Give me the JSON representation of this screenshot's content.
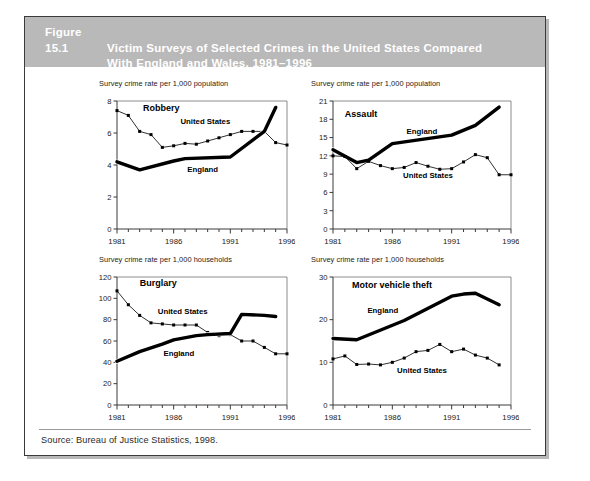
{
  "figure": {
    "number": "Figure 15.1",
    "title": "Victim Surveys of Selected Crimes in the United States Compared With England and Wales, 1981–1996",
    "title_line1": "Victim Surveys of Selected Crimes in the United States Compared",
    "title_line2": "With England and Wales, 1981–1996",
    "source": "Source: Bureau of Justice Statistics, 1998.",
    "title_bar_color": "#b9b9b9",
    "title_text_color": "#ffffff",
    "border_color": "#3a3a3a"
  },
  "chart_data": [
    {
      "type": "line",
      "title": "Robbery",
      "xlabel": "",
      "ylabel": "Survey crime rate per 1,000 population",
      "x": [
        1981,
        1982,
        1983,
        1984,
        1985,
        1986,
        1987,
        1988,
        1989,
        1990,
        1991,
        1992,
        1993,
        1994,
        1995,
        1996
      ],
      "xlim": [
        1981,
        1996
      ],
      "xticks": [
        1981,
        1986,
        1991,
        1996
      ],
      "xticklabels": [
        "1981",
        "1986",
        "1991",
        "1996"
      ],
      "ylim": [
        0,
        8
      ],
      "yticks": [
        0,
        2,
        4,
        6,
        8
      ],
      "yticklabels": [
        "0",
        "2",
        "4",
        "6",
        "8"
      ],
      "grid": false,
      "legend": "inline-annotation",
      "series": [
        {
          "name": "United States",
          "style": "thin-marker",
          "values": [
            7.4,
            7.1,
            6.1,
            5.9,
            5.1,
            5.2,
            5.35,
            5.3,
            5.5,
            5.7,
            5.9,
            6.1,
            6.1,
            6.1,
            5.4,
            5.25
          ]
        },
        {
          "name": "England",
          "style": "thick",
          "values": [
            4.2,
            null,
            3.7,
            null,
            null,
            4.25,
            4.4,
            null,
            null,
            null,
            4.5,
            null,
            null,
            6.1,
            7.6,
            null
          ]
        }
      ]
    },
    {
      "type": "line",
      "title": "Assault",
      "xlabel": "",
      "ylabel": "Survey crime rate per 1,000 population",
      "x": [
        1981,
        1982,
        1983,
        1984,
        1985,
        1986,
        1987,
        1988,
        1989,
        1990,
        1991,
        1992,
        1993,
        1994,
        1995,
        1996
      ],
      "xlim": [
        1981,
        1996
      ],
      "xticks": [
        1981,
        1986,
        1991,
        1996
      ],
      "xticklabels": [
        "1981",
        "1986",
        "1991",
        "1996"
      ],
      "ylim": [
        0,
        21
      ],
      "yticks": [
        0,
        3,
        6,
        9,
        12,
        15,
        18,
        21
      ],
      "yticklabels": [
        "0",
        "3",
        "6",
        "9",
        "12",
        "15",
        "18",
        "21"
      ],
      "grid": false,
      "legend": "inline-annotation",
      "series": [
        {
          "name": "England",
          "style": "thick",
          "values": [
            13.0,
            null,
            10.9,
            11.3,
            null,
            14.0,
            null,
            null,
            null,
            null,
            15.4,
            null,
            17.0,
            null,
            20.0,
            null
          ]
        },
        {
          "name": "United States",
          "style": "thin-marker",
          "values": [
            12.0,
            11.9,
            9.9,
            11.1,
            10.4,
            9.9,
            10.1,
            10.9,
            10.3,
            9.8,
            9.9,
            11.0,
            12.2,
            11.7,
            8.9,
            8.9
          ]
        }
      ]
    },
    {
      "type": "line",
      "title": "Burglary",
      "xlabel": "",
      "ylabel": "Survey crime rate per 1,000 households",
      "x": [
        1981,
        1982,
        1983,
        1984,
        1985,
        1986,
        1987,
        1988,
        1989,
        1990,
        1991,
        1992,
        1993,
        1994,
        1995,
        1996
      ],
      "xlim": [
        1981,
        1996
      ],
      "xticks": [
        1981,
        1986,
        1991,
        1996
      ],
      "xticklabels": [
        "1981",
        "1986",
        "1991",
        "1996"
      ],
      "ylim": [
        0,
        120
      ],
      "yticks": [
        0,
        20,
        40,
        60,
        80,
        100,
        120
      ],
      "yticklabels": [
        "0",
        "20",
        "40",
        "60",
        "80",
        "100",
        "120"
      ],
      "grid": false,
      "legend": "inline-annotation",
      "series": [
        {
          "name": "United States",
          "style": "thin-marker",
          "values": [
            107,
            94,
            84,
            77,
            76,
            75,
            75,
            75,
            68,
            65,
            66,
            60,
            60,
            54,
            48,
            48
          ]
        },
        {
          "name": "England",
          "style": "thick",
          "values": [
            41,
            null,
            50,
            null,
            57,
            61,
            null,
            65,
            66,
            null,
            67,
            85,
            null,
            84,
            83,
            null
          ]
        }
      ]
    },
    {
      "type": "line",
      "title": "Motor vehicle theft",
      "xlabel": "",
      "ylabel": "Survey crime rate per 1,000 households",
      "x": [
        1981,
        1982,
        1983,
        1984,
        1985,
        1986,
        1987,
        1988,
        1989,
        1990,
        1991,
        1992,
        1993,
        1994,
        1995,
        1996
      ],
      "xlim": [
        1981,
        1996
      ],
      "xticks": [
        1981,
        1986,
        1991,
        1996
      ],
      "xticklabels": [
        "1981",
        "1986",
        "1991",
        "1996"
      ],
      "ylim": [
        0,
        30
      ],
      "yticks": [
        0,
        10,
        20,
        30
      ],
      "yticklabels": [
        "0",
        "10",
        "20",
        "30"
      ],
      "grid": false,
      "legend": "inline-annotation",
      "series": [
        {
          "name": "England",
          "style": "thick",
          "values": [
            15.6,
            null,
            15.3,
            null,
            null,
            null,
            19.8,
            null,
            null,
            null,
            25.5,
            26.0,
            26.2,
            null,
            23.5,
            null
          ]
        },
        {
          "name": "United States",
          "style": "thin-marker",
          "values": [
            10.8,
            11.5,
            9.5,
            9.6,
            9.4,
            10.0,
            11.0,
            12.5,
            12.8,
            14.2,
            12.5,
            13.1,
            11.7,
            11.0,
            9.4,
            null
          ]
        }
      ]
    }
  ]
}
